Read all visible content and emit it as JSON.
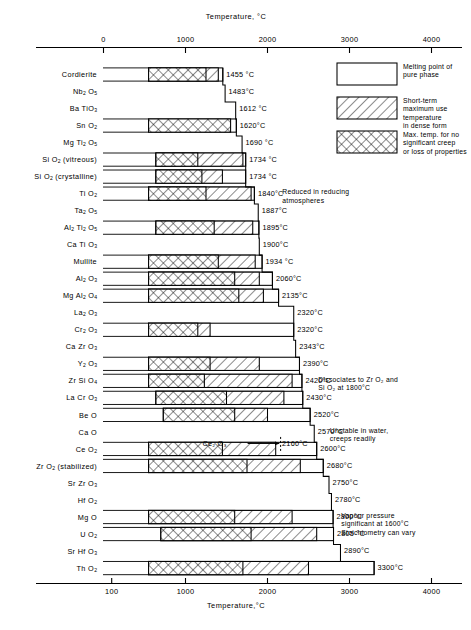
{
  "figure": {
    "top_axis_title": "Temperature, °C",
    "bottom_axis_title": "Temperature,°C",
    "top_ticks": [
      "0",
      "1000",
      "2000",
      "3000",
      "4000"
    ],
    "bottom_ticks": [
      "100",
      "1000",
      "2000",
      "3000",
      "4000"
    ]
  },
  "legend": {
    "items": [
      {
        "key": "melting-point",
        "pattern": "open",
        "text_lines": [
          "Melting point of",
          "pure phase"
        ]
      },
      {
        "key": "short-term-max-use",
        "pattern": "diagonal",
        "text_lines": [
          "Short-term",
          "maximum  use",
          "temperature",
          "in dense form"
        ]
      },
      {
        "key": "max-temp-no-creep",
        "pattern": "cross",
        "text_lines": [
          "Max. temp. for no",
          "significant  creep",
          "or loss of properties"
        ]
      }
    ]
  },
  "chart_data": {
    "type": "bar",
    "title": "Temperature, °C",
    "xlabel": "Temperature,°C",
    "ylabel": "",
    "xlim": [
      0,
      4200
    ],
    "grid": false,
    "legend_position": "top-right",
    "categories": [
      "Cordierite",
      "Nb2 O5",
      "Ba TiO3",
      "Sn O2",
      "Mg Ti2 O5",
      "Si O2  (vitreous)",
      "Si O2  (crystalline)",
      "Ti O2",
      "Ta2 O5",
      "Al2 Ti2 O5",
      "Ca Ti O3",
      "Mullite",
      "Al2 O3",
      "Mg Al2 O4",
      "La2 O3",
      "Cr2 O3",
      "Ca Zr O3",
      "Y2 O3",
      "Zr Si O4",
      "La Cr O3",
      "Be O",
      "Ca O",
      "Ce O2",
      "Zr O2 (stabilized)",
      "Sr Zr O3",
      "Hf O2",
      "Mg O",
      "U O2",
      "Sr Hf O3",
      "Th O2"
    ],
    "series": [
      {
        "name": "Melting point of pure phase",
        "pattern": "open",
        "values": [
          1455,
          1483,
          1612,
          1620,
          1690,
          1734,
          1734,
          1840,
          1887,
          1895,
          1900,
          1934,
          2060,
          2135,
          2320,
          2320,
          2343,
          2390,
          2420,
          2430,
          2520,
          2570,
          2600,
          2680,
          2750,
          2780,
          2800,
          2805,
          2890,
          3300
        ]
      },
      {
        "name": "Short-term maximum use temperature in dense form",
        "pattern": "diagonal",
        "values": [
          1400,
          null,
          null,
          1550,
          null,
          1700,
          1450,
          1800,
          null,
          1820,
          null,
          1850,
          1900,
          1950,
          null,
          1300,
          null,
          1900,
          2300,
          2200,
          2000,
          null,
          2100,
          2400,
          null,
          null,
          2300,
          2600,
          null,
          2500
        ]
      },
      {
        "name": "Max. temp. for no significant creep or loss of properties",
        "pattern": "cross",
        "values": [
          1250,
          null,
          null,
          1550,
          null,
          1150,
          1200,
          1250,
          null,
          1350,
          null,
          1400,
          1600,
          1650,
          null,
          1150,
          null,
          1300,
          1230,
          1500,
          1600,
          null,
          1450,
          1750,
          null,
          null,
          1600,
          1800,
          null,
          1700
        ]
      }
    ],
    "bars": [
      {
        "material": "Cordierite",
        "melt": 1455,
        "melt_label": "1455 °C",
        "short_term": 1400,
        "creep": 1250,
        "bar_start": 550,
        "has_bar": true
      },
      {
        "material": "Nb2 O5",
        "melt": 1483,
        "melt_label": "1483°C",
        "short_term": null,
        "creep": null,
        "bar_start": null,
        "has_bar": false
      },
      {
        "material": "Ba TiO3",
        "melt": 1612,
        "melt_label": "1612 °C",
        "short_term": null,
        "creep": null,
        "bar_start": null,
        "has_bar": false
      },
      {
        "material": "Sn O2",
        "melt": 1620,
        "melt_label": "1620°C",
        "short_term": null,
        "creep": 1550,
        "bar_start": 550,
        "has_bar": true
      },
      {
        "material": "Mg Ti2 O5",
        "melt": 1690,
        "melt_label": "1690 °C",
        "short_term": null,
        "creep": null,
        "bar_start": null,
        "has_bar": false
      },
      {
        "material": "Si O2  (vitreous)",
        "melt": 1734,
        "melt_label": "1734 °C",
        "short_term": 1700,
        "creep": 1150,
        "bar_start": 640,
        "has_bar": true
      },
      {
        "material": "Si O2  (crystalline)",
        "melt": 1734,
        "melt_label": "1734 °C",
        "short_term": 1450,
        "creep": 1200,
        "bar_start": 640,
        "has_bar": true
      },
      {
        "material": "Ti O2",
        "melt": 1840,
        "melt_label": "1840°C",
        "short_term": 1800,
        "creep": 1250,
        "bar_start": 550,
        "has_bar": true
      },
      {
        "material": "Ta2 O5",
        "melt": 1887,
        "melt_label": "1887°C",
        "short_term": null,
        "creep": null,
        "bar_start": null,
        "has_bar": false
      },
      {
        "material": "Al2 Ti2 O5",
        "melt": 1895,
        "melt_label": "1895°C",
        "short_term": 1820,
        "creep": 1350,
        "bar_start": 640,
        "has_bar": true
      },
      {
        "material": "Ca Ti O3",
        "melt": 1900,
        "melt_label": "1900°C",
        "short_term": null,
        "creep": null,
        "bar_start": null,
        "has_bar": false
      },
      {
        "material": "Mullite",
        "melt": 1934,
        "melt_label": "1934 °C",
        "short_term": 1850,
        "creep": 1400,
        "bar_start": 550,
        "has_bar": true
      },
      {
        "material": "Al2 O3",
        "melt": 2060,
        "melt_label": "2060°C",
        "short_term": 1900,
        "creep": 1600,
        "bar_start": 550,
        "has_bar": true
      },
      {
        "material": "Mg Al2 O4",
        "melt": 2135,
        "melt_label": "2135°C",
        "short_term": 1950,
        "creep": 1650,
        "bar_start": 550,
        "has_bar": true
      },
      {
        "material": "La2 O3",
        "melt": 2320,
        "melt_label": "2320°C",
        "short_term": null,
        "creep": null,
        "bar_start": null,
        "has_bar": false
      },
      {
        "material": "Cr2 O3",
        "melt": 2320,
        "melt_label": "2320°C",
        "short_term": 1300,
        "creep": 1150,
        "bar_start": 550,
        "has_bar": true
      },
      {
        "material": "Ca Zr O3",
        "melt": 2343,
        "melt_label": "2343°C",
        "short_term": null,
        "creep": null,
        "bar_start": null,
        "has_bar": false
      },
      {
        "material": "Y2 O3",
        "melt": 2390,
        "melt_label": "2390°C",
        "short_term": 1900,
        "creep": 1300,
        "bar_start": 550,
        "has_bar": true
      },
      {
        "material": "Zr Si O4",
        "melt": 2420,
        "melt_label": "2420°C",
        "short_term": 2300,
        "creep": 1230,
        "bar_start": 550,
        "has_bar": true
      },
      {
        "material": "La Cr O3",
        "melt": 2430,
        "melt_label": "2430°C",
        "short_term": 2200,
        "creep": 1500,
        "bar_start": 640,
        "has_bar": true
      },
      {
        "material": "Be O",
        "melt": 2520,
        "melt_label": "2520°C",
        "short_term": 2000,
        "creep": 1600,
        "bar_start": 730,
        "has_bar": true
      },
      {
        "material": "Ca O",
        "melt": 2570,
        "melt_label": "2570°C",
        "short_term": null,
        "creep": null,
        "bar_start": null,
        "has_bar": false
      },
      {
        "material": "Ce O2",
        "melt": 2600,
        "melt_label": "2600°C",
        "short_term": 2100,
        "creep": 1450,
        "bar_start": 550,
        "has_bar": true
      },
      {
        "material": "Zr O2 (stabilized)",
        "melt": 2680,
        "melt_label": "2680°C",
        "short_term": 2400,
        "creep": 1750,
        "bar_start": 550,
        "has_bar": true
      },
      {
        "material": "Sr Zr O3",
        "melt": 2750,
        "melt_label": "2750°C",
        "short_term": null,
        "creep": null,
        "bar_start": null,
        "has_bar": false
      },
      {
        "material": "Hf O2",
        "melt": 2780,
        "melt_label": "2780°C",
        "short_term": null,
        "creep": null,
        "bar_start": null,
        "has_bar": false
      },
      {
        "material": "Mg O",
        "melt": 2800,
        "melt_label": "2800°C",
        "short_term": 2300,
        "creep": 1600,
        "bar_start": 550,
        "has_bar": true
      },
      {
        "material": "U O2",
        "melt": 2805,
        "melt_label": "2805 °C",
        "short_term": 2600,
        "creep": 1800,
        "bar_start": 700,
        "has_bar": true
      },
      {
        "material": "Sr Hf O3",
        "melt": 2890,
        "melt_label": "2890°C",
        "short_term": null,
        "creep": null,
        "bar_start": null,
        "has_bar": false
      },
      {
        "material": "Th O2",
        "melt": 3300,
        "melt_label": "3300°C",
        "short_term": 2500,
        "creep": 1700,
        "bar_start": 550,
        "has_bar": true
      }
    ],
    "annotations": [
      {
        "key": "reduced-in-reducing",
        "lines": [
          "Reduced in reducing",
          "atmospheres"
        ],
        "near_material": "Ti O2",
        "x": 2180,
        "y_row": 7
      },
      {
        "key": "dissociates-zro2",
        "lines": [
          "Dissociates to Zr O₂ and",
          "Si O₂  at 1800°C"
        ],
        "near_material": "Zr Si O4",
        "x": 2620,
        "y_row": 18
      },
      {
        "key": "unstable-in-water",
        "lines": [
          "Unstable in water,",
          "creeps readily"
        ],
        "near_material": "Ca O",
        "x": 2760,
        "y_row": 21
      },
      {
        "key": "vapour-pressure",
        "lines": [
          "Vapour pressure",
          "significant at 1600°C"
        ],
        "near_material": "Mg O",
        "x": 2900,
        "y_row": 26
      },
      {
        "key": "stoichiometry",
        "lines": [
          "Stoichiometry can vary"
        ],
        "near_material": "U O2",
        "x": 2900,
        "y_row": 27
      },
      {
        "key": "ce2o3-marker",
        "label": "Ce₂ O₃",
        "arrow_to": 2160,
        "value_label": "2160°C",
        "near_material": "Ce O2",
        "y_row": 22
      }
    ]
  }
}
